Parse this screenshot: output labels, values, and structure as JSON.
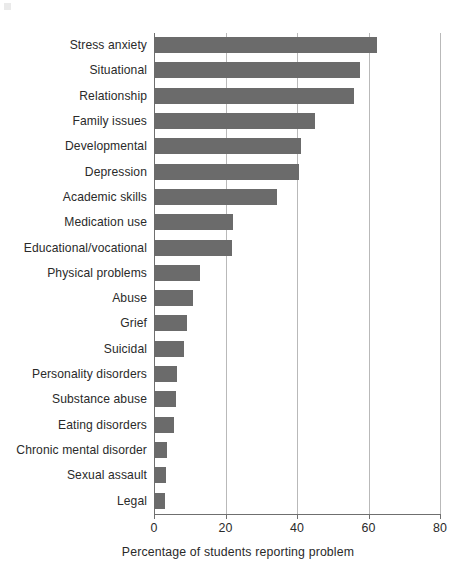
{
  "chart_data": {
    "type": "bar",
    "orientation": "horizontal",
    "title": "",
    "xlabel": "Percentage of students reporting problem",
    "ylabel": "",
    "xlim": [
      0,
      80
    ],
    "xticks": [
      0,
      20,
      40,
      60,
      80
    ],
    "xtick_labels": [
      "0",
      "20",
      "40",
      "60",
      "80"
    ],
    "grid": "vertical",
    "legend": "none",
    "bar_color": "#6b6b6b",
    "categories": [
      "Stress anxiety",
      "Situational",
      "Relationship",
      "Family issues",
      "Developmental",
      "Depression",
      "Academic skills",
      "Medication use",
      "Educational/vocational",
      "Physical problems",
      "Abuse",
      "Grief",
      "Suicidal",
      "Personality disorders",
      "Substance abuse",
      "Eating disorders",
      "Chronic mental disorder",
      "Sexual assault",
      "Legal"
    ],
    "values": [
      62.5,
      57.5,
      56.0,
      45.0,
      41.0,
      40.5,
      34.5,
      22.0,
      21.8,
      13.0,
      11.0,
      9.3,
      8.5,
      6.5,
      6.2,
      5.6,
      3.5,
      3.4,
      3.1
    ]
  }
}
